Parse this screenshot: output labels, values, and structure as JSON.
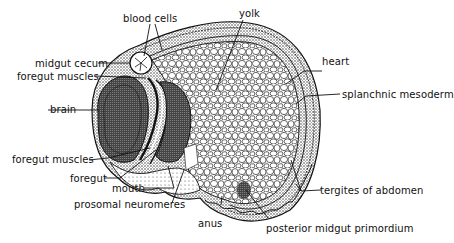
{
  "figure": {
    "labels": {
      "blood_cells": "blood cells",
      "yolk": "yolk",
      "midgut_cecum": "midgut cecum",
      "foregut_muscles_top": "foregut muscles",
      "heart": "heart",
      "brain": "brain",
      "splanchnic_mesoderm": "splanchnic mesoderm",
      "foregut_muscles_bottom": "foregut muscles",
      "foregut": "foregut",
      "mouth": "mouth",
      "prosomal_neuromeres": "prosomal neuromeres",
      "tergites_of_abdomen": "tergites of abdomen",
      "anus": "anus",
      "posterior_midgut_primordium": "posterior midgut primordium"
    },
    "colors": {
      "ink": "#111111",
      "background": "#ffffff"
    }
  }
}
